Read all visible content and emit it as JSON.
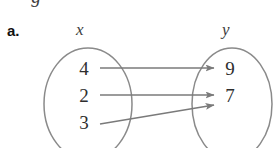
{
  "figure": {
    "part_label": "a.",
    "clipped_top_glyph": "g",
    "domain_label": "x",
    "range_label": "y",
    "domain_values": [
      "4",
      "2",
      "3"
    ],
    "range_values": [
      "9",
      "7"
    ],
    "mappings": [
      {
        "from": "4",
        "to": "9"
      },
      {
        "from": "2",
        "to": "7"
      },
      {
        "from": "3",
        "to": "7"
      }
    ],
    "colors": {
      "ink": "#2e2e2e",
      "label_ink": "#111111",
      "stroke": "#7a7a7a",
      "background": "#ffffff"
    }
  }
}
